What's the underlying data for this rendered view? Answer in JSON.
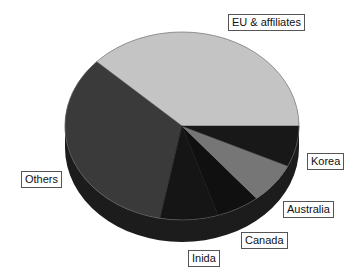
{
  "chart_data": {
    "type": "pie",
    "style": "3d",
    "title": "",
    "start_angle_deg": 0,
    "direction": "counterclockwise",
    "categories": [
      "EU & affiliates",
      "Others",
      "Inida",
      "Canada",
      "Australia",
      "Korea"
    ],
    "values": [
      38,
      34,
      8,
      6,
      7,
      7
    ],
    "unit": "%",
    "colors": [
      "#c4c4c4",
      "#3a3a3a",
      "#151515",
      "#101010",
      "#767676",
      "#181818"
    ],
    "side_color": "#1c1c1c",
    "legend": "none",
    "labels": [
      {
        "text": "EU & affiliates",
        "x": 228,
        "y": 14
      },
      {
        "text": "Others",
        "x": 21,
        "y": 171
      },
      {
        "text": "Inida",
        "x": 188,
        "y": 250
      },
      {
        "text": "Canada",
        "x": 241,
        "y": 232
      },
      {
        "text": "Australia",
        "x": 283,
        "y": 201
      },
      {
        "text": "Korea",
        "x": 307,
        "y": 153
      }
    ]
  },
  "geometry": {
    "cx": 182,
    "cy": 126,
    "rx": 117,
    "ry": 94,
    "depth": 22
  }
}
